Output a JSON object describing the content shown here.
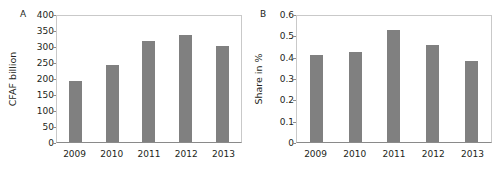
{
  "figure": {
    "width": 504,
    "height": 180,
    "background": "#ffffff",
    "bar_color": "#808080",
    "axis_color": "#8a8a8a",
    "frame_color": "#c9c9c9",
    "text_color": "#231f20"
  },
  "panelA": {
    "letter": "A",
    "ylabel": "CFAF billion",
    "yticks": [
      "400",
      "350",
      "300",
      "250",
      "200",
      "150",
      "100",
      "50",
      "0"
    ],
    "xticks": [
      "2009",
      "2010",
      "2011",
      "2012",
      "2013"
    ]
  },
  "panelB": {
    "letter": "B",
    "ylabel": "Share in %",
    "yticks": [
      "0.6",
      "0.5",
      "0.4",
      "0.3",
      "0.2",
      "0.1",
      "0"
    ],
    "xticks": [
      "2009",
      "2010",
      "2011",
      "2012",
      "2013"
    ]
  },
  "chart_data": [
    {
      "type": "bar",
      "panel": "A",
      "title": "A",
      "xlabel": "",
      "ylabel": "CFAF billion",
      "categories": [
        "2009",
        "2010",
        "2011",
        "2012",
        "2013"
      ],
      "values": [
        195,
        244,
        320,
        341,
        306
      ],
      "ylim": [
        0,
        400
      ],
      "ytick_values": [
        0,
        50,
        100,
        150,
        200,
        250,
        300,
        350,
        400
      ],
      "ytick_labels": [
        "0",
        "50",
        "100",
        "150",
        "200",
        "250",
        "300",
        "350",
        "400"
      ],
      "grid": false,
      "legend": null,
      "bar_color": "#808080"
    },
    {
      "type": "bar",
      "panel": "B",
      "title": "B",
      "xlabel": "",
      "ylabel": "Share in %",
      "categories": [
        "2009",
        "2010",
        "2011",
        "2012",
        "2013"
      ],
      "values": [
        0.415,
        0.427,
        0.532,
        0.462,
        0.387
      ],
      "ylim": [
        0,
        0.6
      ],
      "ytick_values": [
        0,
        0.1,
        0.2,
        0.3,
        0.4,
        0.5,
        0.6
      ],
      "ytick_labels": [
        "0",
        "0.1",
        "0.2",
        "0.3",
        "0.4",
        "0.5",
        "0.6"
      ],
      "grid": false,
      "legend": null,
      "bar_color": "#808080"
    }
  ]
}
